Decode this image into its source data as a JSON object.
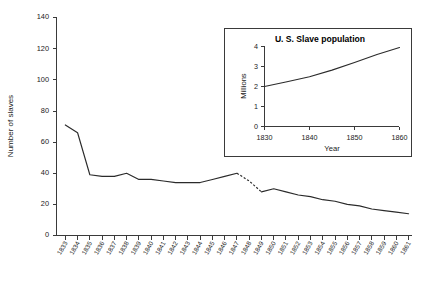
{
  "chart_data": [
    {
      "id": "main",
      "type": "line",
      "title": "",
      "xlabel": "",
      "ylabel": "Number of slaves",
      "xlim": [
        1833,
        1861
      ],
      "ylim": [
        0,
        140
      ],
      "yticks": [
        0,
        20,
        40,
        60,
        80,
        100,
        120,
        140
      ],
      "grid": false,
      "legend": "none",
      "categories": [
        "1833",
        "1834",
        "1835",
        "1836",
        "1837",
        "1838",
        "1839",
        "1840",
        "1841",
        "1842",
        "1843",
        "1844",
        "1845",
        "1846",
        "1847",
        "1848",
        "1849",
        "1850",
        "1851",
        "1852",
        "1853",
        "1854",
        "1855",
        "1856",
        "1857",
        "1858",
        "1859",
        "1860",
        "1861"
      ],
      "series": [
        {
          "name": "Number of slaves",
          "values": [
            71,
            66,
            39,
            38,
            38,
            40,
            36,
            36,
            35,
            34,
            34,
            34,
            36,
            38,
            40,
            35,
            28,
            30,
            28,
            26,
            25,
            23,
            22,
            20,
            19,
            17,
            16,
            15,
            14
          ],
          "dashed_segment": [
            "1847",
            "1849"
          ]
        }
      ]
    },
    {
      "id": "inset",
      "type": "line",
      "title": "U. S. Slave population",
      "xlabel": "Year",
      "ylabel": "Millions",
      "xlim": [
        1830,
        1860
      ],
      "ylim": [
        0,
        4
      ],
      "xticks": [
        1830,
        1840,
        1850,
        1860
      ],
      "yticks": [
        0,
        1,
        2,
        3,
        4
      ],
      "grid": false,
      "legend": "none",
      "x": [
        1830,
        1835,
        1840,
        1845,
        1850,
        1855,
        1860
      ],
      "series": [
        {
          "name": "U. S. Slave population",
          "values": [
            2.0,
            2.24,
            2.49,
            2.82,
            3.2,
            3.6,
            3.95
          ]
        }
      ]
    }
  ]
}
